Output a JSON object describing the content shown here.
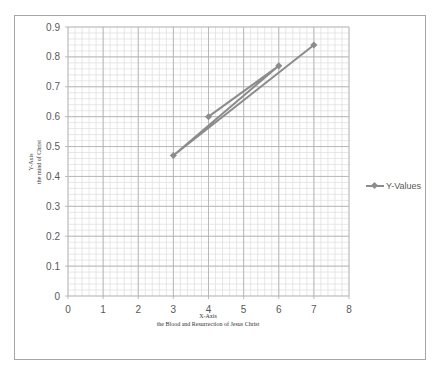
{
  "chart_data": {
    "type": "scatter",
    "subtype": "scatter-with-straight-lines-and-markers",
    "title": "",
    "xlabel": "X-Axis\nthe Blood and Resurrection of Jesus Christ",
    "ylabel": "Y-Axis\nthe mind of Christ",
    "xlabel_line1": "X-Axis",
    "xlabel_line2": "the Blood and Resurrection of Jesus Christ",
    "ylabel_line1": "Y-Axis",
    "ylabel_line2": "the mind of Christ",
    "xlim": [
      0,
      8
    ],
    "ylim": [
      0,
      0.9
    ],
    "xticks": [
      "0",
      "1",
      "2",
      "3",
      "4",
      "5",
      "6",
      "7",
      "8"
    ],
    "yticks": [
      "0",
      "0.1",
      "0.2",
      "0.3",
      "0.4",
      "0.5",
      "0.6",
      "0.7",
      "0.8",
      "0.9"
    ],
    "grid": {
      "major": true,
      "minor": true,
      "minor_per_major": 5
    },
    "legend_position": "right",
    "series": [
      {
        "name": "Y-Values",
        "color": "#8c8c8c",
        "marker": "diamond",
        "x": [
          4,
          6,
          3,
          7
        ],
        "y": [
          0.6,
          0.77,
          0.47,
          0.84
        ]
      }
    ]
  },
  "legend": {
    "label": "Y-Values"
  },
  "colors": {
    "series": "#8c8c8c",
    "major_grid": "#b3b3b3",
    "minor_grid": "#dcdcdc",
    "frame": "#a6a6a6"
  }
}
